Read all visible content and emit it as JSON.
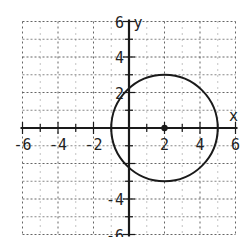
{
  "chart_data": {
    "type": "scatter",
    "title": "",
    "xlabel": "x",
    "ylabel": "y",
    "xlim": [
      -6,
      6
    ],
    "ylim": [
      -6,
      6
    ],
    "grid": true,
    "x_ticks": [
      -6,
      -4,
      -2,
      2,
      4,
      6
    ],
    "y_ticks": [
      6,
      4,
      2,
      -4,
      -6
    ],
    "shapes": [
      {
        "kind": "circle",
        "center": [
          2,
          0
        ],
        "radius": 3
      }
    ],
    "points": [
      {
        "label": "center",
        "x": 2,
        "y": 0
      }
    ]
  },
  "labels": {
    "x_axis": "x",
    "y_axis": "y",
    "x_ticks": [
      "-6",
      "-4",
      "-2",
      "2",
      "4",
      "6"
    ],
    "y_ticks": [
      "6",
      "4",
      "2",
      "-4",
      "-6"
    ]
  },
  "colors": {
    "ink": "#1a1a1a",
    "grid": "#555555",
    "background": "#ffffff"
  }
}
